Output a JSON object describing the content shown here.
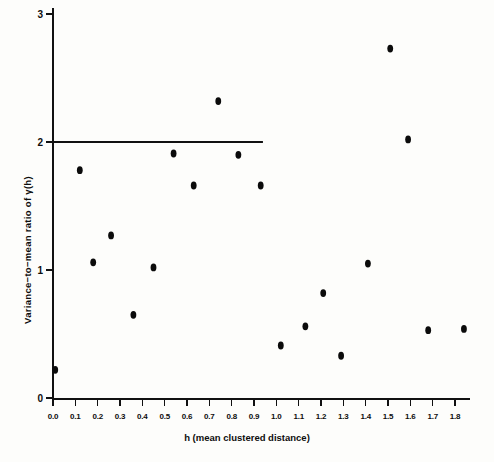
{
  "chart_data": {
    "type": "scatter",
    "title": "",
    "xlabel": "h (mean clustered distance)",
    "ylabel": "Variance−to−mean ratio of γ(h)",
    "xlim": [
      0.0,
      1.8
    ],
    "ylim": [
      0,
      3
    ],
    "grid": false,
    "legend": null,
    "xticks": [
      "0.0",
      "0.1",
      "0.2",
      "0.3",
      "0.4",
      "0.5",
      "0.6",
      "0.7",
      "0.8",
      "0.9",
      "1.0",
      "1.1",
      "1.2",
      "1.3",
      "1.4",
      "1.5",
      "1.6",
      "1.7",
      "1.8"
    ],
    "xtick_values": [
      0.0,
      0.1,
      0.2,
      0.3,
      0.4,
      0.5,
      0.6,
      0.7,
      0.8,
      0.9,
      1.0,
      1.1,
      1.2,
      1.3,
      1.4,
      1.5,
      1.6,
      1.7,
      1.8
    ],
    "yticks": [
      "0",
      "1",
      "2",
      "3"
    ],
    "ytick_values": [
      0,
      1,
      2,
      3
    ],
    "series": [
      {
        "name": "variance-to-mean ratio",
        "marker": "filled-circle",
        "color": "#0b0b0b",
        "points": [
          {
            "x": 0.01,
            "y": 0.22
          },
          {
            "x": 0.12,
            "y": 1.78
          },
          {
            "x": 0.18,
            "y": 1.06
          },
          {
            "x": 0.26,
            "y": 1.27
          },
          {
            "x": 0.36,
            "y": 0.65
          },
          {
            "x": 0.45,
            "y": 1.02
          },
          {
            "x": 0.54,
            "y": 1.91
          },
          {
            "x": 0.63,
            "y": 1.66
          },
          {
            "x": 0.74,
            "y": 2.32
          },
          {
            "x": 0.83,
            "y": 1.9
          },
          {
            "x": 0.93,
            "y": 1.66
          },
          {
            "x": 1.02,
            "y": 0.41
          },
          {
            "x": 1.13,
            "y": 0.56
          },
          {
            "x": 1.21,
            "y": 0.82
          },
          {
            "x": 1.29,
            "y": 0.33
          },
          {
            "x": 1.41,
            "y": 1.05
          },
          {
            "x": 1.51,
            "y": 2.73
          },
          {
            "x": 1.59,
            "y": 2.02
          },
          {
            "x": 1.68,
            "y": 0.53
          },
          {
            "x": 1.84,
            "y": 0.54
          }
        ]
      }
    ],
    "annotations": [
      {
        "type": "horizontal-reference-line",
        "y": 2.0,
        "x_start": 0.0,
        "x_end": 0.94,
        "color": "#111111"
      }
    ]
  }
}
